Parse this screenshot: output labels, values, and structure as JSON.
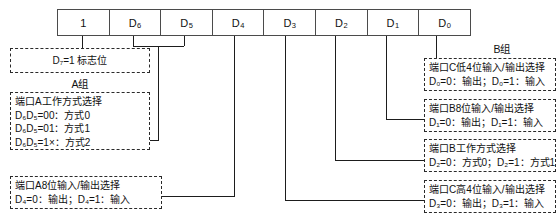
{
  "register": {
    "name": "8255-control-word",
    "bits": [
      {
        "id": "bit-7",
        "label": "1"
      },
      {
        "id": "bit-6",
        "label": "D",
        "sub": "6"
      },
      {
        "id": "bit-5",
        "label": "D",
        "sub": "5"
      },
      {
        "id": "bit-4",
        "label": "D",
        "sub": "4"
      },
      {
        "id": "bit-3",
        "label": "D",
        "sub": "3"
      },
      {
        "id": "bit-2",
        "label": "D",
        "sub": "2"
      },
      {
        "id": "bit-1",
        "label": "D",
        "sub": "1"
      },
      {
        "id": "bit-0",
        "label": "D",
        "sub": "0"
      }
    ]
  },
  "groups": {
    "a_label": "A组",
    "b_label": "B组"
  },
  "annotations": {
    "flag": {
      "line1": "D₇=1 标志位"
    },
    "a_mode": {
      "line1": "端口A工作方式选择",
      "line2": "D₆D₅=00：方式0",
      "line3": "D₆D₅=01：方式1",
      "line4": "D₆D₅=1×：方式2"
    },
    "a_io": {
      "line1": "端口A8位输入/输出选择",
      "line2": "D₄=0：输出；D₄=1：输入"
    },
    "c_low": {
      "line1": "端口C低4位输入/输出选择",
      "line2": "D₀=0：输出；D₀=1：输入"
    },
    "b_io": {
      "line1": "端口B8位输入/输出选择",
      "line2": "D₁=0：输出；D₁=1：输入"
    },
    "b_mode": {
      "line1": "端口B工作方式选择",
      "line2": "D₂=0：方式0；D₂=1：方式1"
    },
    "c_high": {
      "line1": "端口C高4位输入/输出选择",
      "line2": "D₃=0：输出；D₃=1：输入"
    }
  },
  "colors": {
    "line": "#1d1d1d",
    "box_border": "#4b4b4b",
    "background": "#ffffff"
  }
}
